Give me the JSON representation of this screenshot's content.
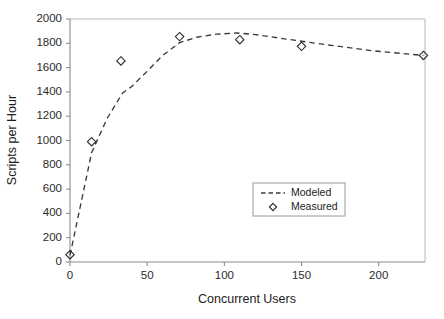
{
  "chart_data": {
    "type": "line",
    "title": "",
    "xlabel": "Concurrent Users",
    "ylabel": "Scripts per Hour",
    "xlim": [
      0,
      230
    ],
    "ylim": [
      0,
      2000
    ],
    "grid": false,
    "legend_position": "inside-lower-right",
    "x_ticks": [
      0,
      50,
      100,
      150,
      200
    ],
    "x_tick_labels": [
      "0",
      "50",
      "100",
      "150",
      "200"
    ],
    "y_ticks": [
      0,
      200,
      400,
      600,
      800,
      1000,
      1200,
      1400,
      1600,
      1800,
      2000
    ],
    "y_tick_labels": [
      "0",
      "200",
      "400",
      "600",
      "800",
      "1000",
      "1200",
      "1400",
      "1600",
      "1800",
      "2000"
    ],
    "series": [
      {
        "name": "Modeled",
        "style": "dashed-line",
        "marker": "none",
        "color": "#3a3a3a",
        "points": [
          {
            "x": 0,
            "y": 55
          },
          {
            "x": 14,
            "y": 900
          },
          {
            "x": 24,
            "y": 1180
          },
          {
            "x": 34,
            "y": 1390
          },
          {
            "x": 40,
            "y": 1445
          },
          {
            "x": 50,
            "y": 1570
          },
          {
            "x": 60,
            "y": 1700
          },
          {
            "x": 71,
            "y": 1805
          },
          {
            "x": 82,
            "y": 1850
          },
          {
            "x": 95,
            "y": 1875
          },
          {
            "x": 108,
            "y": 1885
          },
          {
            "x": 120,
            "y": 1872
          },
          {
            "x": 140,
            "y": 1835
          },
          {
            "x": 165,
            "y": 1790
          },
          {
            "x": 195,
            "y": 1740
          },
          {
            "x": 229,
            "y": 1700
          }
        ]
      },
      {
        "name": "Measured",
        "style": "markers",
        "marker": "diamond",
        "color": "#2b2b2b",
        "points": [
          {
            "x": 0,
            "y": 60
          },
          {
            "x": 14,
            "y": 990
          },
          {
            "x": 33,
            "y": 1655
          },
          {
            "x": 71,
            "y": 1855
          },
          {
            "x": 110,
            "y": 1830
          },
          {
            "x": 150,
            "y": 1775
          },
          {
            "x": 229,
            "y": 1700
          }
        ]
      }
    ],
    "legend": [
      {
        "label": "Modeled",
        "style": "dashed-line"
      },
      {
        "label": "Measured",
        "style": "diamond-marker"
      }
    ],
    "colors": {
      "axis": "#8c8c8c",
      "frame": "#b8b8b8",
      "line": "#3a3a3a",
      "marker": "#2b2b2b",
      "text": "#1c1c1c",
      "background": "#ffffff"
    }
  }
}
